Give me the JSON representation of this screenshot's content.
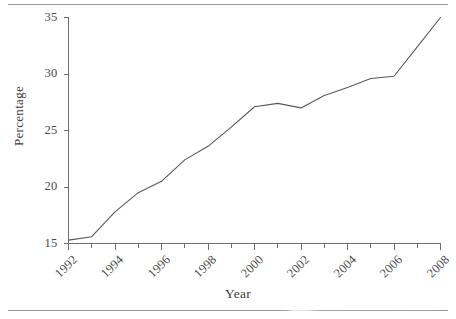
{
  "figure": {
    "axis_color": "#6e6e6e",
    "line_color": "#585858",
    "rule_color": "#9a9a9a"
  },
  "chart_data": {
    "type": "line",
    "title": "",
    "xlabel": "Year",
    "ylabel": "Percentage",
    "xlim": [
      1992,
      2008
    ],
    "ylim": [
      15,
      35
    ],
    "grid": false,
    "legend": null,
    "x_tick_labels": [
      "1992",
      "1994",
      "1996",
      "1998",
      "2000",
      "2002",
      "2004",
      "2006",
      "2008"
    ],
    "x_tick_values": [
      1992,
      1994,
      1996,
      1998,
      2000,
      2002,
      2004,
      2006,
      2008
    ],
    "y_tick_labels": [
      "15",
      "20",
      "25",
      "30",
      "35"
    ],
    "y_tick_values": [
      15,
      20,
      25,
      30,
      35
    ],
    "minor_x_ticks": [
      1993,
      1995,
      1997,
      1999,
      2001,
      2003,
      2005,
      2007
    ],
    "series": [
      {
        "name": "Percentage",
        "x": [
          1992,
          1993,
          1994,
          1995,
          1996,
          1997,
          1998,
          1999,
          2000,
          2001,
          2002,
          2003,
          2004,
          2005,
          2006,
          2007,
          2008
        ],
        "values": [
          15.3,
          15.6,
          17.8,
          19.5,
          20.5,
          22.4,
          23.6,
          25.3,
          27.1,
          27.4,
          27.0,
          28.1,
          28.8,
          29.6,
          29.8,
          32.4,
          35.0
        ]
      }
    ]
  }
}
